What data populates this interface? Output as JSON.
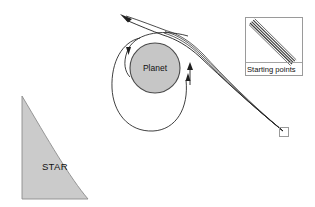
{
  "figure": {
    "background_color": "#ffffff"
  },
  "star": {
    "label": "STAR",
    "fill_color": "#cbcbcb",
    "stroke_color": "#8c8c8c"
  },
  "planet": {
    "label": "Planet",
    "fill_color": "#c6c6c6",
    "stroke_color": "#4a4a4a",
    "center_x": 155,
    "center_y": 68,
    "radius": 25
  },
  "inset": {
    "label": "Starting points",
    "border_color": "#9a9a9a",
    "bundle_line_count": 5,
    "bundle_color": "#3a3a3a"
  },
  "start_marker": {
    "name": "start-box",
    "border_color": "#9a9a9a",
    "x": 279,
    "y": 127,
    "size": 9
  },
  "trajectory": {
    "stroke_color": "#1f1f1f",
    "outgoing_arrow_label": "escape direction",
    "loop_arrow_down_label": "inner loop direction",
    "loop_arrow_up_label": "outer loop direction",
    "bundle_line_count": 4
  }
}
